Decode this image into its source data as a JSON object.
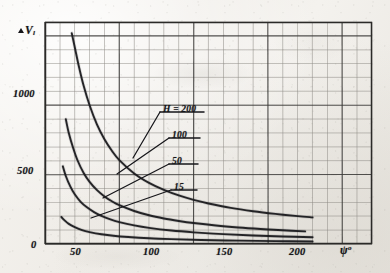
{
  "figure": {
    "media": "scanned engineering graph, photocopied grid paper",
    "y_axis": {
      "name_symbol": "V",
      "name_prefix": "delta",
      "name_subscript": "l",
      "ticks": [
        "1000",
        "500"
      ],
      "origin_label": "0",
      "range": [
        0,
        1600
      ]
    },
    "x_axis": {
      "name_symbol": "psi",
      "name_superscript": "o",
      "ticks": [
        "50",
        "100",
        "150",
        "200"
      ],
      "range": [
        0,
        220
      ]
    },
    "curve_labels": [
      {
        "text": "H = 200",
        "underlined": true
      },
      {
        "text": "100",
        "underlined": true
      },
      {
        "text": "50",
        "underlined": true
      },
      {
        "text": "15",
        "underlined": true
      }
    ]
  },
  "chart_data": {
    "type": "line",
    "title": "",
    "xlabel": "psi (deg)",
    "ylabel": "delta V_l",
    "xlim": [
      0,
      220
    ],
    "ylim": [
      0,
      1600
    ],
    "grid": true,
    "grid_minor_step_x": 10,
    "grid_minor_step_y": 100,
    "grid_major_step_x": 50,
    "grid_major_step_y": 500,
    "legend": "inline curve labels with leader lines",
    "series": [
      {
        "name": "H = 200",
        "color": "#1a1a1e",
        "x": [
          18,
          20,
          23,
          26,
          30,
          35,
          40,
          45,
          50,
          60,
          70,
          80,
          90,
          100,
          110,
          125,
          140,
          155,
          170,
          180
        ],
        "y": [
          1520,
          1420,
          1270,
          1140,
          1000,
          860,
          755,
          672,
          605,
          508,
          440,
          390,
          350,
          318,
          292,
          260,
          236,
          217,
          201,
          192
        ]
      },
      {
        "name": "100",
        "color": "#1a1a1e",
        "x": [
          14,
          16,
          19,
          22,
          26,
          30,
          35,
          40,
          45,
          50,
          60,
          70,
          80,
          90,
          100,
          115,
          130,
          145,
          160,
          175
        ],
        "y": [
          900,
          800,
          690,
          600,
          512,
          448,
          388,
          343,
          308,
          280,
          238,
          207,
          184,
          166,
          151,
          133,
          119,
          108,
          99,
          91
        ]
      },
      {
        "name": "50",
        "color": "#1a1a1e",
        "x": [
          12,
          14,
          17,
          20,
          24,
          28,
          33,
          38,
          44,
          50,
          60,
          70,
          85,
          100,
          120,
          140,
          160,
          180
        ],
        "y": [
          560,
          490,
          415,
          358,
          304,
          266,
          230,
          202,
          177,
          158,
          134,
          116,
          97,
          84,
          71,
          61,
          54,
          49
        ]
      },
      {
        "name": "15",
        "color": "#1a1a1e",
        "x": [
          11,
          13,
          16,
          20,
          25,
          30,
          38,
          46,
          56,
          70,
          85,
          105,
          130,
          155,
          180
        ],
        "y": [
          195,
          172,
          145,
          122,
          100,
          86,
          70,
          59,
          50,
          41,
          35,
          29,
          24,
          21,
          18
        ]
      }
    ]
  }
}
